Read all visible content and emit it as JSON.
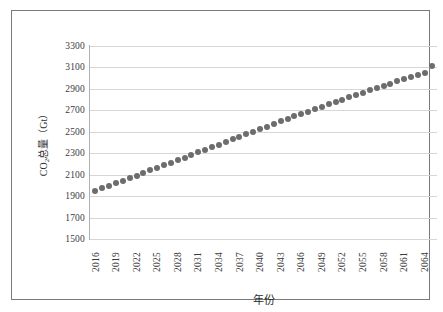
{
  "chart_data": {
    "type": "scatter",
    "title": "",
    "xlabel": "年份",
    "ylabel": "CO₂总量（Gt）",
    "ylabel_parts": {
      "prefix": "CO",
      "sub": "2",
      "suffix": "总量（Gt）"
    },
    "grid": true,
    "legend": false,
    "xlim": [
      2015.2,
      2065.8
    ],
    "ylim": [
      1500,
      3300
    ],
    "ytick_step": 200,
    "ytick_labels": [
      "3300",
      "3100",
      "2900",
      "2700",
      "2500",
      "2300",
      "2100",
      "1900",
      "1700",
      "1500"
    ],
    "ytick_values": [
      3300,
      3100,
      2900,
      2700,
      2500,
      2300,
      2100,
      1900,
      1700,
      1500
    ],
    "xtick_labels": [
      "2016",
      "2019",
      "2022",
      "2025",
      "2028",
      "2031",
      "2034",
      "2037",
      "2040",
      "2043",
      "2046",
      "2049",
      "2052",
      "2055",
      "2058",
      "2061",
      "2064"
    ],
    "xtick_values": [
      2016,
      2019,
      2022,
      2025,
      2028,
      2031,
      2034,
      2037,
      2040,
      2043,
      2046,
      2049,
      2052,
      2055,
      2058,
      2061,
      2064
    ],
    "marker_color": "#6d6d6d",
    "marker_size": 6,
    "gridline_color": "#d6d6d6",
    "axis_color": "#b0b0b0",
    "frame_color": "#7a7a7a",
    "x": [
      2016,
      2017,
      2018,
      2019,
      2020,
      2021,
      2022,
      2023,
      2024,
      2025,
      2026,
      2027,
      2028,
      2029,
      2030,
      2031,
      2032,
      2033,
      2034,
      2035,
      2036,
      2037,
      2038,
      2039,
      2040,
      2041,
      2042,
      2043,
      2044,
      2045,
      2046,
      2047,
      2048,
      2049,
      2050,
      2051,
      2052,
      2053,
      2054,
      2055,
      2056,
      2057,
      2058,
      2059,
      2060,
      2061,
      2062,
      2063,
      2064,
      2065
    ],
    "values": [
      1948,
      1972,
      1996,
      2020,
      2044,
      2068,
      2092,
      2116,
      2140,
      2164,
      2188,
      2212,
      2236,
      2260,
      2284,
      2308,
      2332,
      2356,
      2380,
      2404,
      2428,
      2452,
      2476,
      2500,
      2524,
      2548,
      2572,
      2596,
      2620,
      2643,
      2666,
      2689,
      2712,
      2735,
      2757,
      2779,
      2801,
      2823,
      2845,
      2866,
      2887,
      2908,
      2929,
      2949,
      2969,
      2989,
      3009,
      3029,
      3049,
      3110
    ],
    "series": [
      {
        "name": "CO₂总量",
        "values": [
          1948,
          1972,
          1996,
          2020,
          2044,
          2068,
          2092,
          2116,
          2140,
          2164,
          2188,
          2212,
          2236,
          2260,
          2284,
          2308,
          2332,
          2356,
          2380,
          2404,
          2428,
          2452,
          2476,
          2500,
          2524,
          2548,
          2572,
          2596,
          2620,
          2643,
          2666,
          2689,
          2712,
          2735,
          2757,
          2779,
          2801,
          2823,
          2845,
          2866,
          2887,
          2908,
          2929,
          2949,
          2969,
          2989,
          3009,
          3029,
          3049,
          3110
        ]
      }
    ]
  }
}
